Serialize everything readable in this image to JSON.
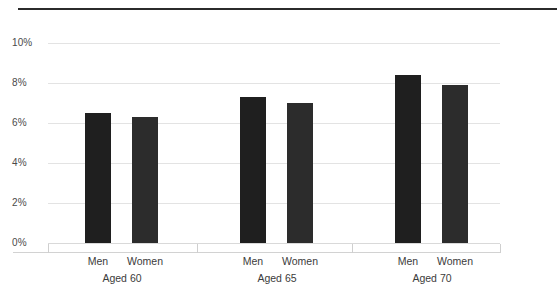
{
  "chart_data": {
    "type": "bar",
    "title": "",
    "subtitle": "",
    "xlabel": "",
    "ylabel": "",
    "ylim": [
      0,
      10
    ],
    "ytick_labels": [
      "0%",
      "2%",
      "4%",
      "6%",
      "8%",
      "10%"
    ],
    "ytick_values": [
      0,
      2,
      4,
      6,
      8,
      10
    ],
    "grid": true,
    "legend": "none",
    "categories": [
      "Aged 60",
      "Aged 65",
      "Aged 70"
    ],
    "series": [
      {
        "name": "Men",
        "values": [
          6.5,
          7.3,
          8.4
        ]
      },
      {
        "name": "Women",
        "values": [
          6.3,
          7.0,
          7.9
        ]
      }
    ],
    "bars": [
      {
        "group": "Aged 60",
        "series": "Men",
        "value": 6.5
      },
      {
        "group": "Aged 60",
        "series": "Women",
        "value": 6.3
      },
      {
        "group": "Aged 65",
        "series": "Men",
        "value": 7.3
      },
      {
        "group": "Aged 65",
        "series": "Women",
        "value": 7.0
      },
      {
        "group": "Aged 70",
        "series": "Men",
        "value": 8.4
      },
      {
        "group": "Aged 70",
        "series": "Women",
        "value": 7.9
      }
    ],
    "colors": {
      "bar_men": "#1f1f1f",
      "bar_women": "#2c2c2c",
      "gridline": "#e3e3e3",
      "top_rule": "#2b2b2b",
      "text": "#3b3b3b",
      "background": "#ffffff"
    }
  },
  "axis": {
    "y": {
      "t0": "0%",
      "t1": "2%",
      "t2": "4%",
      "t3": "6%",
      "t4": "8%",
      "t5": "10%"
    }
  },
  "groups": [
    {
      "label": "Aged 60",
      "bars": [
        {
          "label": "Men",
          "value": 6.5
        },
        {
          "label": "Women",
          "value": 6.3
        }
      ]
    },
    {
      "label": "Aged 65",
      "bars": [
        {
          "label": "Men",
          "value": 7.3
        },
        {
          "label": "Women",
          "value": 7.0
        }
      ]
    },
    {
      "label": "Aged 70",
      "bars": [
        {
          "label": "Men",
          "value": 8.4
        },
        {
          "label": "Women",
          "value": 7.9
        }
      ]
    }
  ]
}
